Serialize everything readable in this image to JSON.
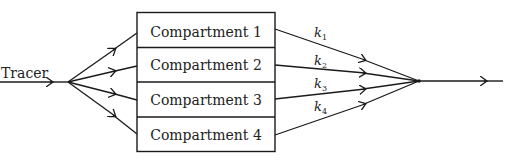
{
  "diagram": {
    "input_label": "Tracer",
    "compartments": [
      {
        "label": "Compartment 1"
      },
      {
        "label": "Compartment 2"
      },
      {
        "label": "Compartment 3"
      },
      {
        "label": "Compartment 4"
      }
    ],
    "rate_constants": [
      {
        "symbol": "k",
        "subscript": "1"
      },
      {
        "symbol": "k",
        "subscript": "2"
      },
      {
        "symbol": "k",
        "subscript": "3"
      },
      {
        "symbol": "k",
        "subscript": "4"
      }
    ],
    "colors": {
      "line": "#1a1a1a",
      "background": "#ffffff"
    }
  }
}
